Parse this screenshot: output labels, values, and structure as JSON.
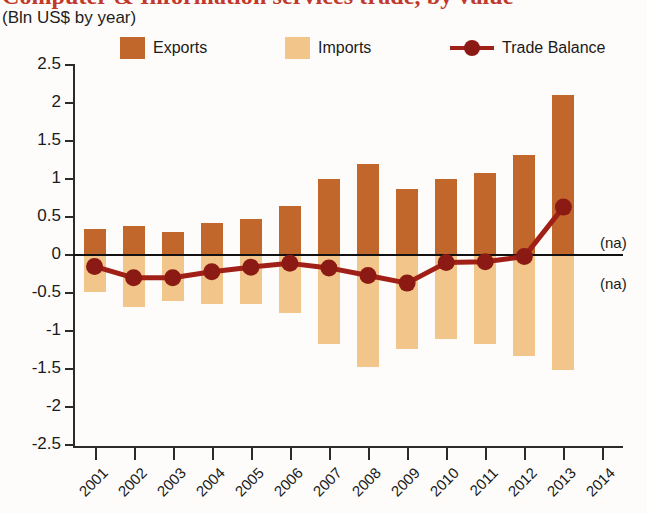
{
  "title": "Computer & Information services trade, by value",
  "subtitle": "(Bln US$ by year)",
  "colors": {
    "exports": "#C1672B",
    "imports": "#F2C68A",
    "balance": "#A02018",
    "title": "#c0392b",
    "axis": "#2b2b2b"
  },
  "legend": {
    "items": [
      {
        "label": "Exports",
        "marker": "square-swatch-icon"
      },
      {
        "label": "Imports",
        "marker": "square-swatch-icon"
      },
      {
        "label": "Trade Balance",
        "marker": "line-dot-marker-icon"
      }
    ]
  },
  "annotations": [
    {
      "name": "na-above",
      "text": "(na)"
    },
    {
      "name": "na-below",
      "text": "(na)"
    }
  ],
  "chart_data": {
    "type": "bar",
    "title": "Computer & Information services trade, by value",
    "subtitle": "(Bln US$ by year)",
    "xlabel": "",
    "ylabel": "",
    "ylim": [
      -2.5,
      2.5
    ],
    "ytick_labels": [
      "2.5",
      "2",
      "1.5",
      "1",
      "0.5",
      "0",
      "-0.5",
      "-1",
      "-1.5",
      "-2",
      "-2.5"
    ],
    "ytick_values": [
      2.5,
      2,
      1.5,
      1,
      0.5,
      0,
      -0.5,
      -1,
      -1.5,
      -2,
      -2.5
    ],
    "grid": false,
    "legend_position": "top",
    "categories": [
      "2001",
      "2002",
      "2003",
      "2004",
      "2005",
      "2006",
      "2007",
      "2008",
      "2009",
      "2010",
      "2011",
      "2012",
      "2013",
      "2014"
    ],
    "series": [
      {
        "name": "Exports",
        "type": "bar",
        "color": "#C1672B",
        "values": [
          0.34,
          0.38,
          0.3,
          0.42,
          0.48,
          0.65,
          1.0,
          1.2,
          0.87,
          1.0,
          1.08,
          1.32,
          2.1,
          null
        ]
      },
      {
        "name": "Imports",
        "type": "bar",
        "color": "#F2C68A",
        "values": [
          -0.49,
          -0.68,
          -0.61,
          -0.64,
          -0.64,
          -0.76,
          -1.17,
          -1.48,
          -1.24,
          -1.1,
          -1.17,
          -1.33,
          -1.51,
          null
        ]
      },
      {
        "name": "Trade Balance",
        "type": "line",
        "color": "#A02018",
        "values": [
          -0.15,
          -0.3,
          -0.3,
          -0.22,
          -0.16,
          -0.11,
          -0.17,
          -0.27,
          -0.37,
          -0.1,
          -0.09,
          -0.02,
          0.63,
          null
        ]
      }
    ]
  }
}
